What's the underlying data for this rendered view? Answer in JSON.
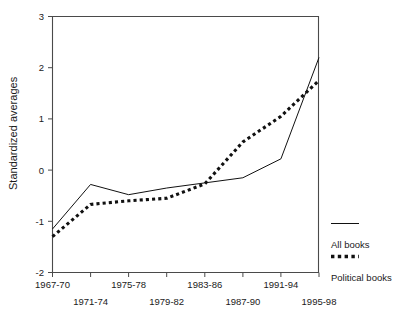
{
  "chart_data": {
    "type": "line",
    "title": "",
    "xlabel": "",
    "ylabel": "Standardized averages",
    "categories": [
      "1967-70",
      "1971-74",
      "1975-78",
      "1979-82",
      "1983-86",
      "1987-90",
      "1991-94",
      "1995-98"
    ],
    "ylim": [
      -2,
      3
    ],
    "yticks": [
      -2,
      -1,
      0,
      1,
      2,
      3
    ],
    "ytick_labels": [
      "-2",
      "-1",
      "0",
      "1",
      "2",
      "3"
    ],
    "grid": false,
    "legend_position": "right",
    "series": [
      {
        "name": "All books",
        "style": "solid",
        "color": "#111111",
        "values": [
          -1.15,
          -0.28,
          -0.48,
          -0.35,
          -0.25,
          -0.15,
          0.22,
          2.2
        ]
      },
      {
        "name": "Political books",
        "style": "dotted",
        "color": "#111111",
        "values": [
          -1.3,
          -0.67,
          -0.6,
          -0.55,
          -0.27,
          0.55,
          1.05,
          1.75
        ]
      }
    ]
  },
  "axes": {
    "y_title": "Standardized averages",
    "y_tick_labels": [
      "3",
      "2",
      "1",
      "0",
      "-1",
      "-2"
    ],
    "x_tick_labels_row_top": [
      "1967-70",
      "1975-78",
      "1983-86",
      "1991-94"
    ],
    "x_tick_labels_row_bottom": [
      "1971-74",
      "1979-82",
      "1987-90",
      "1995-98"
    ]
  },
  "legend": {
    "entries": [
      {
        "label": "All books",
        "style": "solid"
      },
      {
        "label": "Political books",
        "style": "dotted"
      }
    ]
  }
}
